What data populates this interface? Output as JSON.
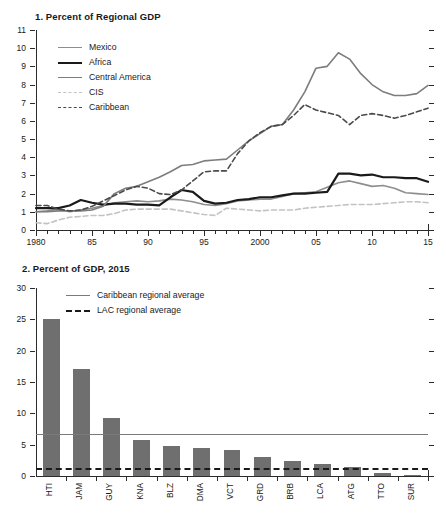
{
  "figure": {
    "width": 446,
    "height": 514,
    "background": "#ffffff",
    "text_color": "#1a1a1a"
  },
  "chart_data": [
    {
      "id": "panel-1",
      "type": "line",
      "title": "1. Percent of Regional GDP",
      "xlabel": "",
      "ylabel": "",
      "xlim": [
        1980,
        2015
      ],
      "ylim": [
        0,
        11
      ],
      "grid": false,
      "legend_position": "upper-left",
      "xticks": [
        1980,
        1985,
        1990,
        1995,
        2000,
        2005,
        2010,
        2015
      ],
      "xticklabels": [
        "1980",
        "85",
        "90",
        "95",
        "2000",
        "05",
        "10",
        "15"
      ],
      "yticks": [
        0,
        1,
        2,
        3,
        4,
        5,
        6,
        7,
        8,
        9,
        10,
        11
      ],
      "yticklabels": [
        "0",
        "1",
        "2",
        "3",
        "4",
        "5",
        "6",
        "7",
        "8",
        "9",
        "10",
        "11"
      ],
      "x": [
        1980,
        1981,
        1982,
        1983,
        1984,
        1985,
        1986,
        1987,
        1988,
        1989,
        1990,
        1991,
        1992,
        1993,
        1994,
        1995,
        1996,
        1997,
        1998,
        1999,
        2000,
        2001,
        2002,
        2003,
        2004,
        2005,
        2006,
        2007,
        2008,
        2009,
        2010,
        2011,
        2012,
        2013,
        2014,
        2015
      ],
      "series": [
        {
          "name": "Mexico",
          "color": "#8e8e8e",
          "style": "solid",
          "width": 1.6,
          "values": [
            1.0,
            1.05,
            1.15,
            1.0,
            1.1,
            1.2,
            1.35,
            1.5,
            1.55,
            1.6,
            1.55,
            1.6,
            1.7,
            1.65,
            1.55,
            1.4,
            1.35,
            1.45,
            1.6,
            1.65,
            1.7,
            1.7,
            1.85,
            2.0,
            2.05,
            2.1,
            2.35,
            2.6,
            2.7,
            2.55,
            2.4,
            2.45,
            2.3,
            2.05,
            2.0,
            1.95
          ]
        },
        {
          "name": "Africa",
          "color": "#1a1a1a",
          "style": "solid",
          "width": 2.2,
          "values": [
            1.2,
            1.2,
            1.2,
            1.35,
            1.65,
            1.5,
            1.4,
            1.45,
            1.45,
            1.4,
            1.4,
            1.35,
            1.8,
            2.2,
            2.1,
            1.6,
            1.45,
            1.5,
            1.65,
            1.7,
            1.8,
            1.8,
            1.9,
            2.0,
            2.0,
            2.05,
            2.1,
            3.1,
            3.1,
            3.0,
            3.05,
            2.9,
            2.9,
            2.85,
            2.85,
            2.65
          ]
        },
        {
          "name": "Central America",
          "color": "#7d7d7d",
          "style": "solid",
          "width": 1.6,
          "values": [
            1.0,
            1.0,
            1.05,
            1.05,
            1.05,
            1.1,
            1.3,
            2.0,
            2.3,
            2.4,
            2.65,
            2.9,
            3.2,
            3.55,
            3.6,
            3.8,
            3.85,
            3.9,
            4.4,
            4.9,
            5.3,
            5.7,
            5.8,
            6.6,
            7.6,
            8.9,
            9.0,
            9.75,
            9.4,
            8.6,
            8.0,
            7.6,
            7.4,
            7.4,
            7.5,
            7.95
          ]
        },
        {
          "name": "CIS",
          "color": "#c3c3c3",
          "style": "dashed",
          "width": 1.6,
          "values": [
            0.4,
            0.35,
            0.55,
            0.7,
            0.75,
            0.8,
            0.8,
            0.9,
            1.1,
            1.15,
            1.15,
            1.15,
            1.15,
            1.05,
            0.95,
            0.85,
            0.8,
            1.2,
            1.15,
            1.1,
            1.05,
            1.1,
            1.1,
            1.1,
            1.2,
            1.25,
            1.3,
            1.35,
            1.4,
            1.4,
            1.4,
            1.45,
            1.5,
            1.55,
            1.55,
            1.5
          ]
        },
        {
          "name": "Caribbean",
          "color": "#4a4a4a",
          "style": "dashed",
          "width": 1.6,
          "values": [
            1.35,
            1.35,
            1.15,
            1.05,
            1.1,
            1.3,
            1.6,
            1.9,
            2.2,
            2.4,
            2.3,
            2.0,
            1.95,
            2.2,
            2.7,
            3.2,
            3.25,
            3.25,
            4.2,
            4.9,
            5.35,
            5.7,
            5.8,
            6.3,
            6.9,
            6.6,
            6.45,
            6.3,
            5.8,
            6.3,
            6.4,
            6.3,
            6.15,
            6.3,
            6.5,
            6.7
          ]
        }
      ]
    },
    {
      "id": "panel-2",
      "type": "bar",
      "title": "2. Percent of GDP, 2015",
      "xlabel": "",
      "ylabel": "",
      "ylim": [
        0,
        30
      ],
      "grid": false,
      "legend_position": "upper-left",
      "yticks": [
        0,
        5,
        10,
        15,
        20,
        25,
        30
      ],
      "yticklabels": [
        "0",
        "5",
        "10",
        "15",
        "20",
        "25",
        "30"
      ],
      "bar_color": "#6f6f6f",
      "categories": [
        "HTI",
        "JAM",
        "GUY",
        "KNA",
        "BLZ",
        "DMA",
        "VCT",
        "GRD",
        "BRB",
        "LCA",
        "ATG",
        "TTO",
        "SUR"
      ],
      "values": [
        25.0,
        17.1,
        9.2,
        5.8,
        4.85,
        4.4,
        4.15,
        3.05,
        2.35,
        1.95,
        1.5,
        0.4,
        0.1
      ],
      "reference_lines": [
        {
          "name": "Caribbean regional average",
          "value": 6.7,
          "color": "#7a7a7a",
          "style": "solid"
        },
        {
          "name": "LAC regional average",
          "value": 1.35,
          "color": "#1a1a1a",
          "style": "dashed"
        }
      ]
    }
  ]
}
